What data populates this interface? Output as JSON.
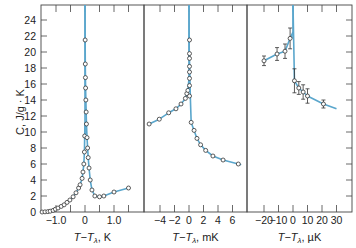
{
  "chart_data": {
    "type": "scatter",
    "title": "",
    "ylabel": "C, J/g · K",
    "ylim": [
      0,
      26
    ],
    "yticks": [
      0,
      2,
      4,
      6,
      8,
      10,
      12,
      14,
      16,
      18,
      20,
      22,
      24
    ],
    "grid": false,
    "legend": null,
    "line_color": "#5aa6cc",
    "marker": "open circle",
    "panels": [
      {
        "xlabel": "T−T",
        "xlabel_sub": "λ",
        "xlabel_unit": ", K",
        "xlim": [
          -1.5,
          1.8
        ],
        "xticks": [
          -1.0,
          -0.5,
          0,
          0.5,
          1.0,
          1.5
        ],
        "xtick_labels": [
          "−1.0",
          "",
          "0",
          "",
          "1.0",
          ""
        ],
        "series": [
          {
            "name": "below T_lambda",
            "x": [
              -1.48,
              -1.38,
              -1.28,
              -1.2,
              -1.1,
              -1.02,
              -0.93,
              -0.82,
              -0.72,
              -0.62,
              -0.52,
              -0.41,
              -0.31,
              -0.22,
              -0.17,
              -0.1,
              -0.07,
              -0.04,
              -0.02,
              -0.01
            ],
            "y": [
              0,
              0.02,
              0.05,
              0.1,
              0.2,
              0.35,
              0.5,
              0.7,
              0.9,
              1.2,
              1.5,
              1.9,
              2.4,
              3.0,
              3.4,
              4.2,
              5.0,
              6.0,
              7.5,
              9.5
            ]
          },
          {
            "name": "above T_lambda",
            "x": [
              0.005,
              0.01,
              0.015,
              0.02,
              0.03,
              0.04,
              0.05,
              0.07,
              0.09,
              0.11,
              0.14,
              0.18,
              0.24,
              0.34,
              0.5,
              0.65,
              1.0,
              1.5
            ],
            "y": [
              21.5,
              18.5,
              16.8,
              15.5,
              14.0,
              12.5,
              11.0,
              9.3,
              8.0,
              6.8,
              5.5,
              4.0,
              2.75,
              2.0,
              1.9,
              2.0,
              2.5,
              3.0
            ]
          }
        ]
      },
      {
        "xlabel": "T−T",
        "xlabel_sub": "λ",
        "xlabel_unit": ", mK",
        "xlim": [
          -6.2,
          7.8
        ],
        "xticks": [
          -4,
          -2,
          0,
          2,
          4,
          6
        ],
        "xtick_labels": [
          "−4",
          "−2",
          "0",
          "2",
          "4",
          "6"
        ],
        "series": [
          {
            "name": "below T_lambda",
            "x": [
              -5.5,
              -4.1,
              -2.8,
              -1.8,
              -1.1,
              -0.5,
              -0.3,
              -0.15
            ],
            "y": [
              11.0,
              11.6,
              12.4,
              12.9,
              13.5,
              14.2,
              14.8,
              15.2
            ]
          },
          {
            "name": "above T_lambda",
            "x": [
              0.02,
              0.04,
              0.06,
              0.08,
              0.1,
              0.12,
              0.15,
              0.18,
              0.3,
              0.7,
              1.1,
              1.6,
              2.3,
              3.3,
              4.7,
              6.8
            ],
            "y": [
              21.5,
              19.8,
              19.2,
              18.2,
              17.5,
              16.7,
              15.8,
              14.5,
              11.2,
              10.2,
              9.2,
              8.4,
              7.7,
              7.0,
              6.5,
              6.0
            ]
          }
        ]
      },
      {
        "xlabel": "T−T",
        "xlabel_sub": "λ",
        "xlabel_unit": ", µK",
        "xlim": [
          -31,
          40
        ],
        "xticks": [
          -20,
          -10,
          0,
          10,
          20,
          30
        ],
        "xtick_labels": [
          "−20",
          "−10",
          "0",
          "10",
          "20",
          "30"
        ],
        "series": [
          {
            "name": "below T_lambda",
            "x": [
              -20,
              -11,
              -5.5,
              -2
            ],
            "y": [
              18.9,
              19.75,
              20.1,
              21.7
            ],
            "yerr": [
              0.6,
              0.8,
              0.9,
              1.3
            ]
          },
          {
            "name": "above T_lambda",
            "x": [
              1,
              4,
              7,
              10,
              21
            ],
            "y": [
              16.4,
              15.5,
              15.0,
              14.5,
              13.5
            ],
            "yerr": [
              1.5,
              0.8,
              0.9,
              0.9,
              0.5
            ]
          }
        ]
      }
    ]
  }
}
